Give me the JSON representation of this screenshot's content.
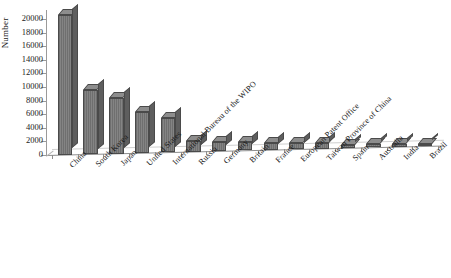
{
  "chart_data": {
    "type": "bar",
    "title": "",
    "subtitle": "",
    "xlabel": "",
    "ylabel": "Number",
    "ylim": [
      0,
      20000
    ],
    "ytick_step": 2000,
    "grid": false,
    "legend": false,
    "legend_position": "none",
    "orientation": "vertical",
    "style": "3d-bar",
    "bar_color": "#7a7a7a",
    "bar_edge_color": "#4a4a4a",
    "yticks": [
      "0",
      "2000",
      "4000",
      "6000",
      "8000",
      "10000",
      "12000",
      "14000",
      "16000",
      "18000",
      "20000"
    ],
    "categories": [
      "China",
      "South Korea",
      "Japan",
      "United States",
      "International Bureau of the WIPO",
      "Russia",
      "Germany",
      "Britain",
      "France",
      "European Patent Office",
      "Taiwan Province of China",
      "Spain",
      "Australia",
      "India",
      "Brazil"
    ],
    "values": [
      20500,
      9500,
      8200,
      6000,
      5100,
      1500,
      1350,
      1200,
      1000,
      850,
      800,
      500,
      450,
      400,
      350
    ],
    "series": [
      {
        "name": "Number",
        "values": [
          20500,
          9500,
          8200,
          6000,
          5100,
          1500,
          1350,
          1200,
          1000,
          850,
          800,
          500,
          450,
          400,
          350
        ]
      }
    ]
  }
}
